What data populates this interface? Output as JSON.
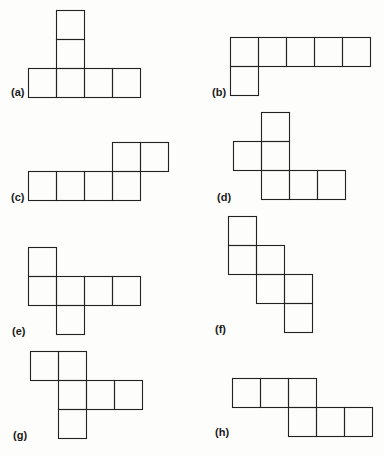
{
  "figure": {
    "stroke_color": "#222222",
    "background": "#fdfdfc",
    "cell_size": 28,
    "nets": [
      {
        "id": "a",
        "label": "(a)",
        "label_pos": [
          11,
          86
        ],
        "cells": [
          [
            56,
            10
          ],
          [
            56,
            39
          ],
          [
            28,
            68
          ],
          [
            56,
            68
          ],
          [
            84,
            68
          ],
          [
            112,
            68
          ]
        ]
      },
      {
        "id": "b",
        "label": "(b)",
        "label_pos": [
          212,
          86
        ],
        "cells": [
          [
            230,
            37
          ],
          [
            258,
            37
          ],
          [
            286,
            37
          ],
          [
            314,
            37
          ],
          [
            342,
            37
          ],
          [
            230,
            66
          ]
        ]
      },
      {
        "id": "c",
        "label": "(c)",
        "label_pos": [
          11,
          191
        ],
        "cells": [
          [
            112,
            142
          ],
          [
            140,
            142
          ],
          [
            28,
            171
          ],
          [
            56,
            171
          ],
          [
            84,
            171
          ],
          [
            112,
            171
          ]
        ]
      },
      {
        "id": "d",
        "label": "(d)",
        "label_pos": [
          217,
          191
        ],
        "cells": [
          [
            261,
            112
          ],
          [
            233,
            141
          ],
          [
            261,
            141
          ],
          [
            261,
            170
          ],
          [
            289,
            170
          ],
          [
            317,
            170
          ]
        ]
      },
      {
        "id": "e",
        "label": "(e)",
        "label_pos": [
          12,
          325
        ],
        "cells": [
          [
            28,
            247
          ],
          [
            28,
            276
          ],
          [
            56,
            276
          ],
          [
            84,
            276
          ],
          [
            112,
            276
          ],
          [
            56,
            305
          ]
        ]
      },
      {
        "id": "f",
        "label": "(f)",
        "label_pos": [
          215,
          323
        ],
        "cells": [
          [
            228,
            216
          ],
          [
            228,
            245
          ],
          [
            256,
            245
          ],
          [
            256,
            274
          ],
          [
            284,
            274
          ],
          [
            284,
            303
          ]
        ]
      },
      {
        "id": "g",
        "label": "(g)",
        "label_pos": [
          13,
          429
        ],
        "cells": [
          [
            30,
            351
          ],
          [
            58,
            351
          ],
          [
            58,
            380
          ],
          [
            86,
            380
          ],
          [
            114,
            380
          ],
          [
            58,
            409
          ]
        ]
      },
      {
        "id": "h",
        "label": "(h)",
        "label_pos": [
          215,
          426
        ],
        "cells": [
          [
            232,
            378
          ],
          [
            260,
            378
          ],
          [
            288,
            378
          ],
          [
            288,
            407
          ],
          [
            316,
            407
          ],
          [
            344,
            407
          ]
        ]
      }
    ]
  }
}
